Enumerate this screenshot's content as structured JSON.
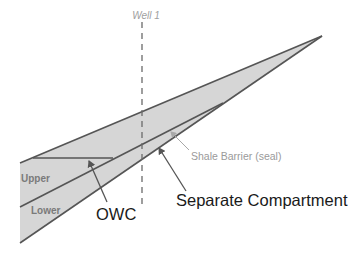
{
  "diagram": {
    "colors": {
      "fill": "#d6d6d6",
      "boundary": "#555555",
      "shale_arrow": "#a8a8a8",
      "well_line": "#6a6a6a"
    },
    "well": {
      "label": "Well 1"
    },
    "zones": {
      "upper": "Upper",
      "lower": "Lower"
    },
    "annotations": {
      "owc": "OWC",
      "shale_barrier": "Shale Barrier (seal)",
      "separate_compartment": "Separate Compartment"
    }
  }
}
